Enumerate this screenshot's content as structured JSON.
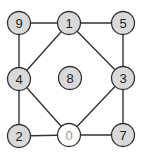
{
  "diagram": {
    "type": "graph",
    "colors": {
      "node_fill": "#d9d9d9",
      "node_stroke": "#333333",
      "node_text": "#222222",
      "highlight_fill": "#ffffff",
      "highlight_stroke": "#777777",
      "highlight_text": "#999999",
      "edge": "#333333"
    },
    "nodes": [
      {
        "id": "9",
        "label": "9",
        "x": 19,
        "y": 23,
        "highlighted": false
      },
      {
        "id": "1",
        "label": "1",
        "x": 69,
        "y": 23,
        "highlighted": false
      },
      {
        "id": "5",
        "label": "5",
        "x": 123,
        "y": 23,
        "highlighted": false
      },
      {
        "id": "4",
        "label": "4",
        "x": 19,
        "y": 79,
        "highlighted": false
      },
      {
        "id": "8",
        "label": "8",
        "x": 70,
        "y": 78,
        "highlighted": false
      },
      {
        "id": "3",
        "label": "3",
        "x": 123,
        "y": 78,
        "highlighted": false
      },
      {
        "id": "2",
        "label": "2",
        "x": 19,
        "y": 136,
        "highlighted": false
      },
      {
        "id": "0",
        "label": "0",
        "x": 69,
        "y": 135,
        "highlighted": true
      },
      {
        "id": "7",
        "label": "7",
        "x": 123,
        "y": 135,
        "highlighted": false
      }
    ],
    "edges": [
      [
        "9",
        "1"
      ],
      [
        "1",
        "5"
      ],
      [
        "9",
        "4"
      ],
      [
        "4",
        "2"
      ],
      [
        "5",
        "3"
      ],
      [
        "3",
        "7"
      ],
      [
        "2",
        "0"
      ],
      [
        "0",
        "7"
      ],
      [
        "1",
        "4"
      ],
      [
        "1",
        "3"
      ],
      [
        "4",
        "0"
      ],
      [
        "3",
        "0"
      ]
    ],
    "node_radius": 11.5
  }
}
